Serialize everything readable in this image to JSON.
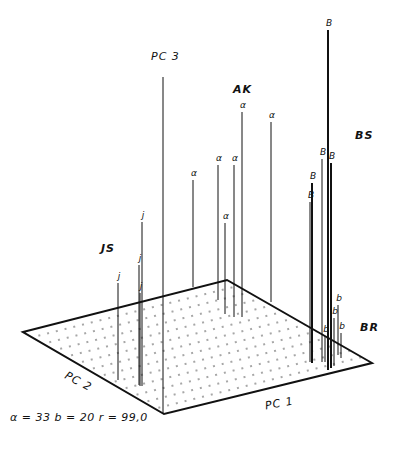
{
  "chart_data": {
    "type": "scatter",
    "variant": "3d-stem",
    "title": "",
    "axes": {
      "x": {
        "label": "PC 1"
      },
      "y": {
        "label": "PC 2"
      },
      "z": {
        "label": "PC 3"
      }
    },
    "groups": [
      {
        "name": "AK",
        "marker": "a"
      },
      {
        "name": "BS",
        "marker": "B"
      },
      {
        "name": "BR",
        "marker": "b"
      },
      {
        "name": "JS",
        "marker": "j"
      }
    ],
    "annotation": "α=33  b=20  r=99,0",
    "projection": {
      "plane_corners": {
        "left": [
          23,
          332
        ],
        "top": [
          227,
          280
        ],
        "right": [
          372,
          363
        ],
        "bottom": [
          164,
          414
        ]
      },
      "pc3_axis": {
        "x": 163,
        "top": 77,
        "bottom": 414
      }
    },
    "points": [
      {
        "group": "AK",
        "marker": "a",
        "x": 193,
        "top": 180,
        "base": 287
      },
      {
        "group": "AK",
        "marker": "a",
        "x": 218,
        "top": 165,
        "base": 300
      },
      {
        "group": "AK",
        "marker": "a",
        "x": 234,
        "top": 165,
        "base": 317
      },
      {
        "group": "AK",
        "marker": "a",
        "x": 242,
        "top": 112,
        "base": 317
      },
      {
        "group": "AK",
        "marker": "a",
        "x": 271,
        "top": 122,
        "base": 302
      },
      {
        "group": "AK",
        "marker": "a",
        "x": 225,
        "top": 223,
        "base": 314
      },
      {
        "group": "JS",
        "marker": "j",
        "x": 142,
        "top": 222,
        "base": 386
      },
      {
        "group": "JS",
        "marker": "j",
        "x": 118,
        "top": 283,
        "base": 380
      },
      {
        "group": "JS",
        "marker": "j",
        "x": 139,
        "top": 265,
        "base": 385
      },
      {
        "group": "JS",
        "marker": "j",
        "x": 140,
        "top": 293,
        "base": 386
      },
      {
        "group": "BS",
        "marker": "B",
        "x": 328,
        "top": 30,
        "base": 370,
        "heavy": true
      },
      {
        "group": "BS",
        "marker": "B",
        "x": 322,
        "top": 159,
        "base": 362
      },
      {
        "group": "BS",
        "marker": "B",
        "x": 331,
        "top": 163,
        "base": 368,
        "heavy": true
      },
      {
        "group": "BS",
        "marker": "B",
        "x": 312,
        "top": 183,
        "base": 363,
        "heavy": true
      },
      {
        "group": "BS",
        "marker": "B",
        "x": 310,
        "top": 202,
        "base": 362
      },
      {
        "group": "BR",
        "marker": "b",
        "x": 325,
        "top": 336,
        "base": 362
      },
      {
        "group": "BR",
        "marker": "b",
        "x": 334,
        "top": 318,
        "base": 366
      },
      {
        "group": "BR",
        "marker": "b",
        "x": 338,
        "top": 305,
        "base": 355
      },
      {
        "group": "BR",
        "marker": "b",
        "x": 341,
        "top": 333,
        "base": 358
      }
    ]
  },
  "labels": {
    "pc1": "PC 1",
    "pc2": "PC 2",
    "pc3": "PC 3",
    "ak": "AK",
    "bs": "BS",
    "br": "BR",
    "js": "JS",
    "footnote": "α = 33   b = 20   r = 99,0"
  }
}
